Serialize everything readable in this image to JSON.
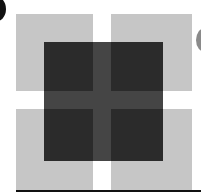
{
  "figure": {
    "colors": {
      "background": "#ffffff",
      "light_square": "#c6c6c6",
      "dark_overlay": "#2b2b2b",
      "cross_inside_overlay": "#454545",
      "left_edge_circle": "#111111",
      "right_edge_circle": "#8a8a8a",
      "bottom_line": "#111111"
    },
    "panels": [
      {
        "name": "top-left",
        "x": 16,
        "y": 14,
        "w": 77,
        "h": 77
      },
      {
        "name": "top-right",
        "x": 111,
        "y": 14,
        "w": 81,
        "h": 77
      },
      {
        "name": "bottom-left",
        "x": 16,
        "y": 109,
        "w": 77,
        "h": 81
      },
      {
        "name": "bottom-right",
        "x": 111,
        "y": 109,
        "w": 81,
        "h": 81
      }
    ],
    "overlay": {
      "x": 44,
      "y": 42,
      "w": 119,
      "h": 119
    }
  }
}
